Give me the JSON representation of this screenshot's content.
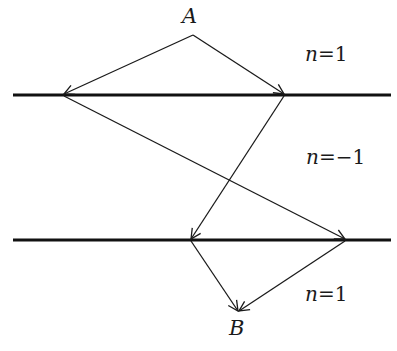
{
  "diagram": {
    "points": {
      "A": {
        "label": "A"
      },
      "B": {
        "label": "B"
      }
    },
    "regions": [
      {
        "var": "n",
        "eq": "=",
        "value": "1"
      },
      {
        "var": "n",
        "eq": "=",
        "value": "−1"
      },
      {
        "var": "n",
        "eq": "=",
        "value": "1"
      }
    ],
    "colors": {
      "ink": "#1a1a1a",
      "background": "#ffffff"
    }
  }
}
